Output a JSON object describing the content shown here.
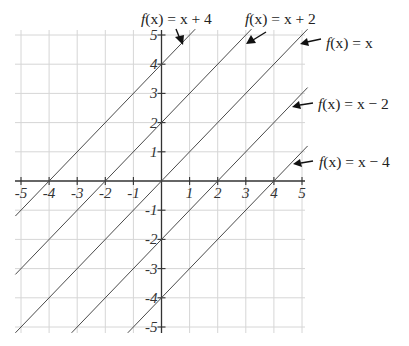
{
  "chart_data": {
    "type": "line",
    "title": "",
    "xlabel": "",
    "ylabel": "",
    "xlim": [
      -5,
      5
    ],
    "ylim": [
      -5,
      5
    ],
    "grid": true,
    "x_ticks": [
      -5,
      -4,
      -3,
      -2,
      -1,
      1,
      2,
      3,
      4,
      5
    ],
    "y_ticks": [
      5,
      4,
      3,
      2,
      1,
      -1,
      -2,
      -3,
      -4,
      -5
    ],
    "x_tick_labels": [
      "-5",
      "-4",
      "-3",
      "-2",
      "-1",
      "1",
      "2",
      "3",
      "4",
      "5"
    ],
    "y_tick_labels": [
      "5",
      "4",
      "3",
      "2",
      "1",
      "-1",
      "-2",
      "-3",
      "-4",
      "-5"
    ],
    "series": [
      {
        "name": "f(x) = x + 4",
        "slope": 1,
        "intercept": 4,
        "label": "f(x) = x + 4"
      },
      {
        "name": "f(x) = x + 2",
        "slope": 1,
        "intercept": 2,
        "label": "f(x) = x + 2"
      },
      {
        "name": "f(x) = x",
        "slope": 1,
        "intercept": 0,
        "label": "f(x) = x"
      },
      {
        "name": "f(x) = x - 2",
        "slope": 1,
        "intercept": -2,
        "label": "f(x) = x − 2"
      },
      {
        "name": "f(x) = x - 4",
        "slope": 1,
        "intercept": -4,
        "label": "f(x) = x − 4"
      }
    ],
    "annotations": [
      {
        "text": "f(x) = x + 4",
        "arrow_to_series": "f(x) = x + 4",
        "position": "top"
      },
      {
        "text": "f(x) = x + 2",
        "arrow_to_series": "f(x) = x + 2",
        "position": "top"
      },
      {
        "text": "f(x) = x",
        "arrow_to_series": "f(x) = x",
        "position": "right"
      },
      {
        "text": "f(x) = x − 2",
        "arrow_to_series": "f(x) = x - 2",
        "position": "right"
      },
      {
        "text": "f(x) = x − 4",
        "arrow_to_series": "f(x) = x - 4",
        "position": "right"
      }
    ]
  },
  "labels": {
    "l0": {
      "f": "f",
      "rest": "(x) = x + 4"
    },
    "l1": {
      "f": "f",
      "rest": "(x) = x + 2"
    },
    "l2": {
      "f": "f",
      "rest": "(x) = x"
    },
    "l3": {
      "f": "f",
      "rest": "(x) = x − 2"
    },
    "l4": {
      "f": "f",
      "rest": "(x) = x − 4"
    }
  }
}
